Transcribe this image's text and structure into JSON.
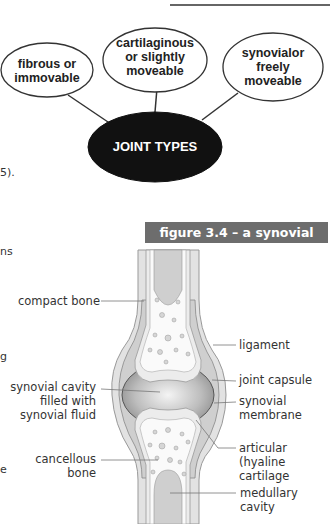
{
  "concept_map": {
    "center": "JOINT TYPES",
    "nodes": [
      {
        "id": "fibrous",
        "lines": [
          "fibrous or",
          "immovable"
        ]
      },
      {
        "id": "cartilaginous",
        "lines": [
          "cartilaginous",
          "or slightly",
          "moveable"
        ]
      },
      {
        "id": "synovial",
        "lines": [
          "synovialor",
          "freely",
          "moveable"
        ]
      }
    ]
  },
  "margin_fragments": {
    "f1": "5).",
    "f2": "ns",
    "f3": "g",
    "f4": "e"
  },
  "figure": {
    "title": "figure 3.4 – a synovial joint",
    "labels_left": {
      "compact_bone": "compact bone",
      "synovial_cavity_1": "synovial cavity",
      "synovial_cavity_2": "filled with",
      "synovial_cavity_3": "synovial fluid",
      "cancellous_1": "cancellous",
      "cancellous_2": "bone"
    },
    "labels_right": {
      "ligament": "ligament",
      "joint_capsule": "joint capsule",
      "synovial_membrane_1": "synovial",
      "synovial_membrane_2": "membrane",
      "articular_1": "articular (hyaline",
      "articular_2": "cartilage",
      "medullary": "medullary cavity"
    }
  }
}
